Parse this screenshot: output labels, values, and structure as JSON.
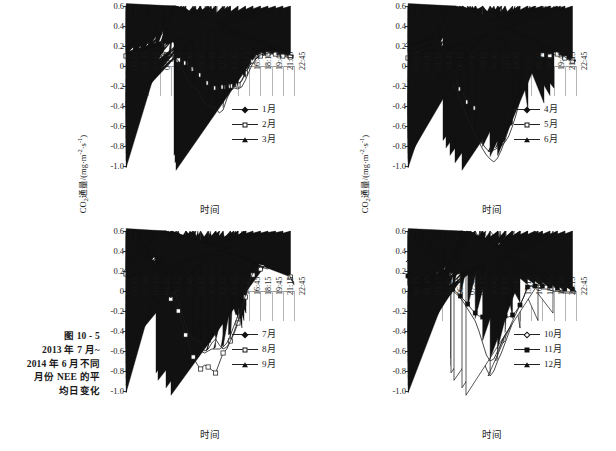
{
  "figure": {
    "caption_lines": [
      "图 10 - 5",
      "2013 年 7 月~",
      "2014 年 6 月不同",
      "月份 NEE 的平",
      "均日变化"
    ],
    "axis": {
      "ylabel_prefix": "CO",
      "ylabel_sub": "2",
      "ylabel_mid": "通量/(mg·m",
      "ylabel_sup1": "-2",
      "ylabel_dot": "·s",
      "ylabel_sup2": "-1",
      "ylabel_suffix": ")",
      "xlabel": "时间",
      "yticks": [
        "0.6",
        "0.4",
        "0.2",
        "0",
        "-0.2",
        "-0.4",
        "-0.6",
        "-0.8",
        "-1.0"
      ],
      "xticks": [
        "00:15",
        "01:45",
        "03:15",
        "04:45",
        "06:15",
        "07:45",
        "09:15",
        "10:45",
        "12:15",
        "13:45",
        "15:15",
        "16:45",
        "18:15",
        "19:45",
        "21:15",
        "22:45"
      ]
    }
  },
  "chart_data": [
    {
      "type": "line",
      "panel": "top-left",
      "title": "",
      "xlabel": "时间",
      "ylabel": "CO2通量/(mg·m-2·s-1)",
      "ylim": [
        -1.0,
        0.6
      ],
      "xlim": [
        "00:15",
        "22:45"
      ],
      "grid": true,
      "legend_position": "bottom-right",
      "x": [
        "00:15",
        "00:45",
        "01:15",
        "01:45",
        "02:15",
        "02:45",
        "03:15",
        "03:45",
        "04:15",
        "04:45",
        "05:15",
        "05:45",
        "06:15",
        "06:45",
        "07:15",
        "07:45",
        "08:15",
        "08:45",
        "09:15",
        "09:45",
        "10:15",
        "10:45",
        "11:15",
        "11:45",
        "12:15",
        "12:45",
        "13:15",
        "13:45",
        "14:15",
        "14:45",
        "15:15",
        "15:45",
        "16:15",
        "16:45",
        "17:15",
        "17:45",
        "18:15",
        "18:45",
        "19:15",
        "19:45",
        "20:15",
        "20:45",
        "21:15",
        "21:45",
        "22:15",
        "22:45"
      ],
      "series": [
        {
          "name": "1月",
          "marker": "diamond",
          "values": [
            0.1,
            0.09,
            0.1,
            0.11,
            0.11,
            0.12,
            0.13,
            0.14,
            0.13,
            0.13,
            0.12,
            0.12,
            0.11,
            0.09,
            0.07,
            0.05,
            0.01,
            -0.06,
            -0.14,
            -0.2,
            -0.25,
            -0.28,
            -0.3,
            -0.31,
            -0.31,
            -0.3,
            -0.28,
            -0.24,
            -0.21,
            -0.2,
            -0.19,
            -0.15,
            -0.08,
            0.0,
            0.05,
            0.08,
            0.1,
            0.11,
            0.11,
            0.12,
            0.12,
            0.11,
            0.11,
            0.1,
            0.1,
            0.1
          ]
        },
        {
          "name": "2月",
          "marker": "square",
          "values": [
            0.1,
            0.08,
            0.06,
            0.05,
            0.04,
            0.03,
            0.04,
            0.08,
            0.1,
            0.1,
            0.09,
            0.08,
            0.07,
            0.07,
            0.06,
            0.05,
            0.03,
            0.0,
            -0.03,
            -0.06,
            -0.09,
            -0.13,
            -0.17,
            -0.2,
            -0.22,
            -0.22,
            -0.21,
            -0.2,
            -0.2,
            -0.21,
            -0.19,
            -0.14,
            -0.07,
            0.0,
            0.05,
            0.08,
            0.1,
            0.11,
            0.12,
            0.13,
            0.12,
            0.11,
            0.1,
            0.09,
            0.09,
            0.08
          ]
        },
        {
          "name": "3月",
          "marker": "triangle",
          "values": [
            0.1,
            0.11,
            0.12,
            0.12,
            0.11,
            0.13,
            0.17,
            0.13,
            0.14,
            0.15,
            0.14,
            0.13,
            0.12,
            0.1,
            0.05,
            -0.02,
            -0.1,
            -0.17,
            -0.21,
            -0.23,
            -0.3,
            -0.37,
            -0.39,
            -0.41,
            -0.42,
            -0.47,
            -0.44,
            -0.33,
            -0.25,
            -0.22,
            -0.23,
            -0.21,
            -0.14,
            -0.05,
            0.03,
            0.08,
            0.11,
            0.12,
            0.13,
            0.13,
            0.14,
            0.13,
            0.12,
            0.12,
            0.11,
            0.1
          ]
        }
      ]
    },
    {
      "type": "line",
      "panel": "top-right",
      "title": "",
      "xlabel": "时间",
      "ylabel": "CO2通量/(mg·m-2·s-1)",
      "ylim": [
        -1.0,
        0.6
      ],
      "xlim": [
        "00:15",
        "22:45"
      ],
      "grid": true,
      "legend_position": "bottom-right",
      "x": [
        "00:15",
        "00:45",
        "01:15",
        "01:45",
        "02:15",
        "02:45",
        "03:15",
        "03:45",
        "04:15",
        "04:45",
        "05:15",
        "05:45",
        "06:15",
        "06:45",
        "07:15",
        "07:45",
        "08:15",
        "08:45",
        "09:15",
        "09:45",
        "10:15",
        "10:45",
        "11:15",
        "11:45",
        "12:15",
        "12:45",
        "13:15",
        "13:45",
        "14:15",
        "14:45",
        "15:15",
        "15:45",
        "16:15",
        "16:45",
        "17:15",
        "17:45",
        "18:15",
        "18:45",
        "19:15",
        "19:45",
        "20:15",
        "20:45",
        "21:15",
        "21:45",
        "22:15",
        "22:45"
      ],
      "series": [
        {
          "name": "4月",
          "marker": "diamond",
          "values": [
            0.22,
            0.13,
            0.1,
            0.14,
            0.16,
            0.15,
            0.15,
            0.14,
            0.13,
            0.13,
            0.1,
            0.02,
            -0.08,
            -0.2,
            -0.31,
            -0.4,
            -0.47,
            -0.54,
            -0.62,
            -0.7,
            -0.78,
            -0.83,
            -0.86,
            -0.84,
            -0.82,
            -0.8,
            -0.76,
            -0.7,
            -0.6,
            -0.48,
            -0.33,
            -0.18,
            -0.04,
            0.12,
            0.18,
            0.19,
            0.25,
            0.26,
            0.22,
            0.2,
            0.18,
            0.15,
            0.13,
            0.08,
            0.06,
            0.06
          ]
        },
        {
          "name": "5月",
          "marker": "square",
          "values": [
            0.08,
            0.07,
            0.09,
            0.12,
            0.13,
            0.13,
            0.12,
            0.12,
            0.13,
            0.12,
            0.09,
            0.02,
            -0.06,
            -0.15,
            -0.23,
            -0.3,
            -0.36,
            -0.4,
            -0.42,
            -0.44,
            -0.48,
            -0.55,
            -0.57,
            -0.57,
            -0.55,
            -0.52,
            -0.47,
            -0.4,
            -0.32,
            -0.24,
            -0.16,
            -0.08,
            0.0,
            0.06,
            0.09,
            0.1,
            0.11,
            0.11,
            0.1,
            0.11,
            0.12,
            0.11,
            0.08,
            0.06,
            0.05,
            0.05
          ]
        },
        {
          "name": "6月",
          "marker": "triangle",
          "values": [
            0.12,
            0.1,
            0.11,
            0.13,
            0.15,
            0.14,
            0.14,
            0.14,
            0.16,
            0.1,
            0.05,
            -0.04,
            -0.15,
            -0.25,
            -0.34,
            -0.43,
            -0.52,
            -0.6,
            -0.68,
            -0.76,
            -0.83,
            -0.89,
            -0.93,
            -0.96,
            -0.92,
            -0.84,
            -0.74,
            -0.62,
            -0.5,
            -0.38,
            -0.26,
            -0.14,
            -0.02,
            0.1,
            0.17,
            0.2,
            0.21,
            0.23,
            0.2,
            0.17,
            0.14,
            0.12,
            0.09,
            0.07,
            0.06,
            0.05
          ]
        }
      ]
    },
    {
      "type": "line",
      "panel": "bottom-left",
      "title": "",
      "xlabel": "时间",
      "ylabel": "CO2通量/(mg·m-2·s-1)",
      "ylim": [
        -1.0,
        0.6
      ],
      "xlim": [
        "00:15",
        "22:45"
      ],
      "grid": true,
      "legend_position": "bottom-right",
      "x": [
        "00:15",
        "00:45",
        "01:15",
        "01:45",
        "02:15",
        "02:45",
        "03:15",
        "03:45",
        "04:15",
        "04:45",
        "05:15",
        "05:45",
        "06:15",
        "06:45",
        "07:15",
        "07:45",
        "08:15",
        "08:45",
        "09:15",
        "09:45",
        "10:15",
        "10:45",
        "11:15",
        "11:45",
        "12:15",
        "12:45",
        "13:15",
        "13:45",
        "14:15",
        "14:45",
        "15:15",
        "15:45",
        "16:15",
        "16:45",
        "17:15",
        "17:45",
        "18:15",
        "18:45",
        "19:15",
        "19:45",
        "20:15",
        "20:45",
        "21:15",
        "21:45",
        "22:15",
        "22:45"
      ],
      "series": [
        {
          "name": "7月",
          "marker": "diamond",
          "values": [
            0.2,
            0.18,
            0.21,
            0.22,
            0.21,
            0.22,
            0.21,
            0.22,
            0.2,
            0.18,
            0.1,
            0.0,
            -0.09,
            -0.04,
            -0.12,
            -0.22,
            -0.33,
            -0.44,
            -0.52,
            -0.56,
            -0.6,
            -0.62,
            -0.6,
            -0.58,
            -0.58,
            -0.58,
            -0.56,
            -0.52,
            -0.44,
            -0.34,
            -0.24,
            -0.12,
            0.0,
            0.12,
            0.2,
            0.24,
            0.26,
            0.28,
            0.3,
            0.33,
            0.28,
            0.23,
            0.2,
            0.18,
            0.15,
            0.08
          ]
        },
        {
          "name": "8月",
          "marker": "square",
          "values": [
            0.17,
            0.17,
            0.19,
            0.2,
            0.2,
            0.2,
            0.21,
            0.22,
            0.2,
            0.17,
            0.08,
            -0.02,
            -0.08,
            -0.1,
            -0.2,
            -0.32,
            -0.44,
            -0.56,
            -0.66,
            -0.73,
            -0.78,
            -0.74,
            -0.76,
            -0.79,
            -0.82,
            -0.72,
            -0.62,
            -0.58,
            -0.5,
            -0.42,
            -0.32,
            -0.2,
            -0.06,
            0.08,
            0.16,
            0.2,
            0.22,
            0.25,
            0.28,
            0.31,
            0.3,
            0.28,
            0.26,
            0.2,
            0.14,
            0.07
          ]
        },
        {
          "name": "9月",
          "marker": "triangle",
          "values": [
            0.19,
            0.18,
            0.2,
            0.21,
            0.21,
            0.21,
            0.22,
            0.21,
            0.19,
            0.16,
            0.09,
            -0.01,
            -0.07,
            0.0,
            -0.1,
            -0.22,
            -0.34,
            -0.44,
            -0.48,
            -0.5,
            -0.52,
            -0.6,
            -0.58,
            -0.52,
            -0.48,
            -0.54,
            -0.58,
            -0.56,
            -0.5,
            -0.4,
            -0.3,
            -0.18,
            -0.04,
            0.1,
            0.18,
            0.22,
            0.24,
            0.23,
            0.22,
            0.25,
            0.32,
            0.34,
            0.28,
            0.2,
            0.14,
            0.06
          ]
        }
      ]
    },
    {
      "type": "line",
      "panel": "bottom-right",
      "title": "",
      "xlabel": "时间",
      "ylabel": "CO2通量/(mg·m-2·s-1)",
      "ylim": [
        -1.0,
        0.6
      ],
      "xlim": [
        "00:15",
        "22:45"
      ],
      "grid": true,
      "legend_position": "bottom-right",
      "x": [
        "00:15",
        "00:45",
        "01:15",
        "01:45",
        "02:15",
        "02:45",
        "03:15",
        "03:45",
        "04:15",
        "04:45",
        "05:15",
        "05:45",
        "06:15",
        "06:45",
        "07:15",
        "07:45",
        "08:15",
        "08:45",
        "09:15",
        "09:45",
        "10:15",
        "10:45",
        "11:15",
        "11:45",
        "12:15",
        "12:45",
        "13:15",
        "13:45",
        "14:15",
        "14:45",
        "15:15",
        "15:45",
        "16:15",
        "16:45",
        "17:15",
        "17:45",
        "18:15",
        "18:45",
        "19:15",
        "19:45",
        "20:15",
        "20:45",
        "21:15",
        "21:45",
        "22:15",
        "22:45"
      ],
      "series": [
        {
          "name": "10月",
          "marker": "diamond-open",
          "values": [
            0.29,
            0.18,
            0.15,
            0.17,
            0.19,
            0.19,
            0.18,
            0.16,
            0.09,
            0.04,
            0.02,
            0.0,
            -0.02,
            -0.06,
            -0.12,
            -0.2,
            -0.38,
            -0.36,
            -0.46,
            -0.58,
            -0.68,
            -0.78,
            -0.85,
            -0.8,
            -0.7,
            -0.62,
            -0.52,
            -0.42,
            -0.32,
            -0.22,
            -0.12,
            -0.02,
            0.05,
            0.1,
            0.17,
            0.18,
            0.17,
            0.18,
            0.17,
            0.16,
            0.14,
            0.1,
            0.06,
            0.05,
            0.02,
            -0.01
          ]
        },
        {
          "name": "11月",
          "marker": "square-fill",
          "values": [
            0.15,
            0.12,
            0.1,
            0.09,
            0.08,
            0.08,
            0.06,
            0.06,
            0.05,
            0.04,
            0.05,
            0.04,
            0.02,
            -0.01,
            -0.05,
            -0.09,
            -0.13,
            -0.18,
            -0.22,
            -0.25,
            -0.26,
            -0.28,
            -0.24,
            -0.22,
            -0.22,
            -0.23,
            -0.25,
            -0.26,
            -0.24,
            -0.2,
            -0.14,
            -0.06,
            0.04,
            0.05,
            0.05,
            0.06,
            0.05,
            0.06,
            0.05,
            0.04,
            0.03,
            0.0,
            0.02,
            0.04,
            0.02,
            0.0
          ]
        },
        {
          "name": "12月",
          "marker": "triangle",
          "values": [
            0.05,
            0.05,
            0.05,
            0.06,
            0.06,
            0.05,
            0.05,
            0.06,
            0.06,
            0.05,
            0.04,
            0.02,
            0.0,
            -0.03,
            -0.07,
            -0.12,
            -0.18,
            -0.24,
            -0.3,
            -0.4,
            -0.52,
            -0.64,
            -0.7,
            -0.68,
            -0.6,
            -0.52,
            -0.44,
            -0.38,
            -0.3,
            -0.22,
            -0.14,
            -0.06,
            0.04,
            0.05,
            0.04,
            0.03,
            0.02,
            0.02,
            0.01,
            0.0,
            0.0,
            -0.01,
            -0.02,
            -0.02,
            -0.02,
            -0.02
          ]
        }
      ]
    }
  ]
}
